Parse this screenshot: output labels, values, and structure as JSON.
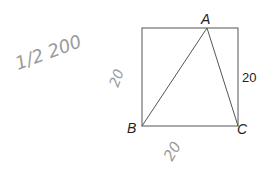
{
  "diagram": {
    "type": "geometry",
    "square": {
      "x": 142,
      "y": 28,
      "size": 97
    },
    "points": {
      "A": {
        "label": "A",
        "x": 207,
        "y": 28
      },
      "B": {
        "label": "B",
        "x": 142,
        "y": 126
      },
      "C": {
        "label": "C",
        "x": 238,
        "y": 126
      }
    },
    "printed_labels": {
      "right_side": "20"
    },
    "handwritten": {
      "top_left": "1/2 200",
      "left_side": "20",
      "bottom": "20"
    },
    "colors": {
      "line": "#555555",
      "text": "#222222",
      "pencil": "#9a9a9a"
    }
  }
}
